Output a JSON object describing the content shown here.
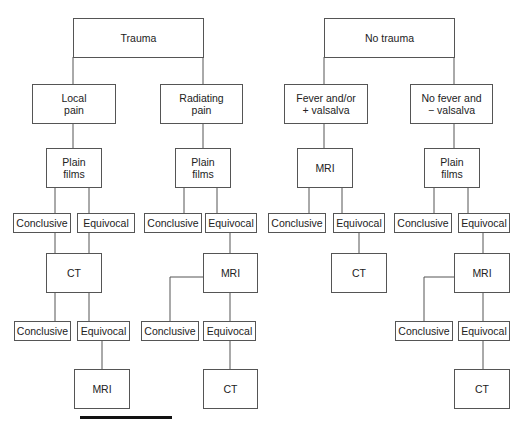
{
  "diagram": {
    "left_tree": {
      "root": "Trauma",
      "branches": [
        {
          "label": "Local\npain",
          "step1": "Plain\nfilms",
          "step1_outcomes": [
            "Conclusive",
            "Equivocal"
          ],
          "step2": "CT",
          "step2_outcomes": [
            "Conclusive",
            "Equivocal"
          ],
          "step3": "MRI"
        },
        {
          "label": "Radiating\npain",
          "step1": "Plain\nfilms",
          "step1_outcomes": [
            "Conclusive",
            "Equivocal"
          ],
          "step2": "MRI",
          "step2_outcomes": [
            "Conclusive",
            "Equivocal"
          ],
          "step3": "CT"
        }
      ]
    },
    "right_tree": {
      "root": "No trauma",
      "branches": [
        {
          "label": "Fever and/or\n+ valsalva",
          "step1": "MRI",
          "step1_outcomes": [
            "Conclusive",
            "Equivocal"
          ],
          "step2": "CT"
        },
        {
          "label": "No fever and\n− valsalva",
          "step1": "Plain\nfilms",
          "step1_outcomes": [
            "Conclusive",
            "Equivocal"
          ],
          "step2": "MRI",
          "step2_outcomes": [
            "Conclusive",
            "Equivocal"
          ],
          "step3": "CT"
        }
      ]
    }
  }
}
